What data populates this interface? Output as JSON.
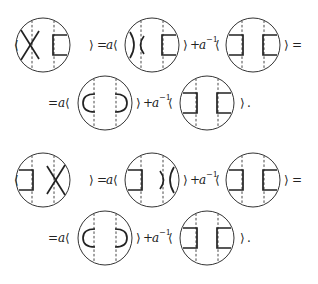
{
  "equations": [
    {
      "id": "eq1",
      "line1": {
        "lhs_open": "⟨",
        "lhs_close": "⟩",
        "eq": "=",
        "coef1": "a",
        "open1": "⟨",
        "close1": "⟩",
        "plus": "+",
        "coef2": "a",
        "coef2_exp": "−1",
        "open2": "⟨",
        "close2": "⟩",
        "trail": "="
      },
      "line2": {
        "lead": "=",
        "coef1": "a",
        "open1": "⟨",
        "close1": "⟩",
        "plus": "+",
        "coef2": "a",
        "coef2_exp": "−1",
        "open2": "⟨",
        "close2": "⟩",
        "end": "."
      },
      "diagrams": [
        "crossing-left-bar-right",
        "smoothing-vertical-left-bar-right",
        "two-bars",
        "caps-outward",
        "two-bars"
      ]
    },
    {
      "id": "eq2",
      "line1": {
        "lhs_open": "⟨",
        "lhs_close": "⟩",
        "eq": "=",
        "coef1": "a",
        "open1": "⟨",
        "close1": "⟩",
        "plus": "+",
        "coef2": "a",
        "coef2_exp": "−1",
        "open2": "⟨",
        "close2": "⟩",
        "trail": "="
      },
      "line2": {
        "lead": "=",
        "coef1": "a",
        "open1": "⟨",
        "close1": "⟩",
        "plus": "+",
        "coef2": "a",
        "coef2_exp": "−1",
        "open2": "⟨",
        "close2": "⟩",
        "end": "."
      },
      "diagrams": [
        "bar-left-crossing-right",
        "bar-left-smoothing-vertical-right",
        "two-bars",
        "caps-outward",
        "two-bars"
      ]
    }
  ]
}
